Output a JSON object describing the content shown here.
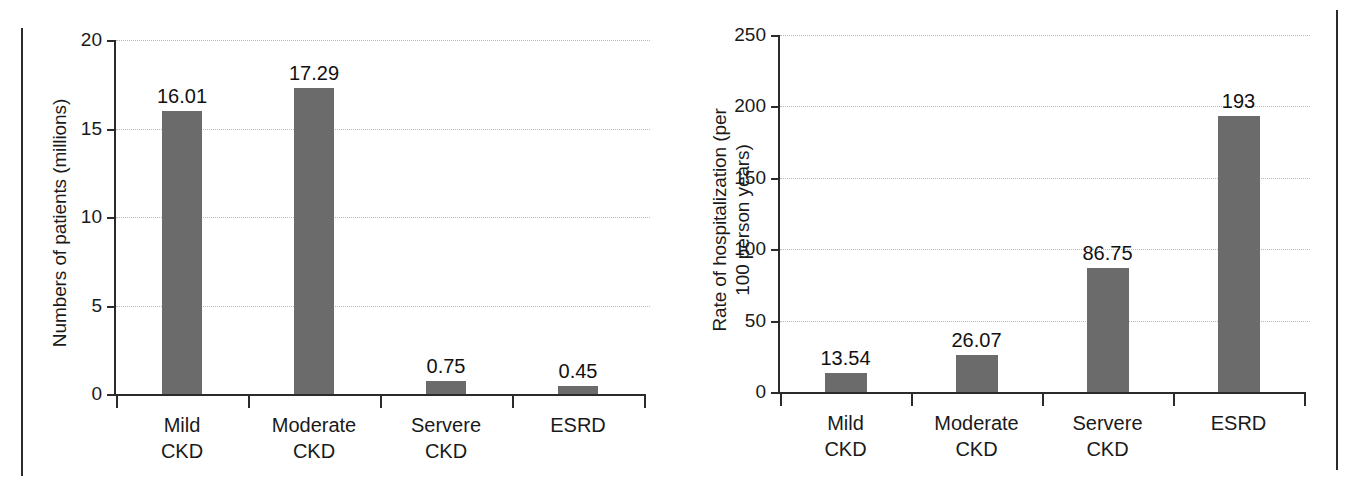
{
  "chart_data": [
    {
      "type": "bar",
      "name": "patients-chart",
      "title": "",
      "xlabel": "",
      "ylabel": "Numbers of patients (millions)",
      "categories": [
        "Mild\nCKD",
        "Moderate\nCKD",
        "Servere\nCKD",
        "ESRD"
      ],
      "values": [
        16.01,
        17.29,
        0.75,
        0.45
      ],
      "value_labels": [
        "16.01",
        "17.29",
        "0.75",
        "0.45"
      ],
      "ylim": [
        0,
        20
      ],
      "yticks": [
        0,
        5,
        10,
        15,
        20
      ],
      "ytick_labels": [
        "0",
        "5",
        "10",
        "15",
        "20"
      ],
      "grid": true,
      "legend": "none",
      "bar_color": "#6b6b6b",
      "axis_color": "#2b2b2b",
      "grid_color": "#b9b9b9"
    },
    {
      "type": "bar",
      "name": "hospitalization-chart",
      "title": "",
      "xlabel": "",
      "ylabel": "Rate of hospitalization (per\n100 person years)",
      "categories": [
        "Mild\nCKD",
        "Moderate\nCKD",
        "Servere\nCKD",
        "ESRD"
      ],
      "values": [
        13.54,
        26.07,
        86.75,
        193
      ],
      "value_labels": [
        "13.54",
        "26.07",
        "86.75",
        "193"
      ],
      "ylim": [
        0,
        250
      ],
      "yticks": [
        0,
        50,
        100,
        150,
        200,
        250
      ],
      "ytick_labels": [
        "0",
        "50",
        "100",
        "150",
        "200",
        "250"
      ],
      "grid": true,
      "legend": "none",
      "bar_color": "#6b6b6b",
      "axis_color": "#2b2b2b",
      "grid_color": "#b9b9b9"
    }
  ]
}
